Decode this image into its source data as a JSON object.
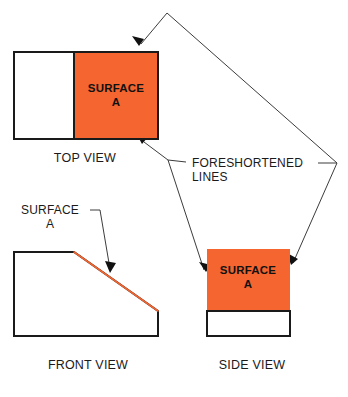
{
  "figure": {
    "title_text_present": false,
    "background_color": "#ffffff",
    "surface_color": "#f4652f",
    "line_color": "#1a1a1a",
    "leader_color": "#3c3c3c"
  },
  "views": {
    "top": {
      "label": "TOP VIEW",
      "label_x": 85,
      "label_y": 162,
      "outline": {
        "x": 14,
        "y": 52,
        "width": 144,
        "height": 87
      },
      "plain_part": {
        "x": 14,
        "y": 52,
        "width": 60,
        "height": 87
      },
      "surface_part": {
        "x": 74,
        "y": 52,
        "width": 84,
        "height": 87
      },
      "surface_label_line1": "SURFACE",
      "surface_label_line2": "A",
      "surface_label_x": 116,
      "surface_label_y": 92
    },
    "front": {
      "label": "FRONT VIEW",
      "label_x": 88,
      "label_y": 369,
      "outline_points": "14,252 74,252 158,311 158,336 14,336",
      "incline_points": "74,252 158,311",
      "callout_line1": "SURFACE",
      "callout_line2": "A",
      "callout_x": 50,
      "callout_y": 214
    },
    "side": {
      "label": "SIDE VIEW",
      "label_x": 252,
      "label_y": 369,
      "surface_part": {
        "x": 207,
        "y": 249,
        "width": 83,
        "height": 62
      },
      "plain_part": {
        "x": 207,
        "y": 311,
        "width": 83,
        "height": 25
      },
      "surface_label_line1": "SURFACE",
      "surface_label_line2": "A",
      "surface_label_x": 248,
      "surface_label_y": 274
    }
  },
  "callouts": {
    "foreshortened": {
      "line1": "FORESHORTENED",
      "line2": "LINES",
      "x": 192,
      "y_line1": 167,
      "y_line2": 181
    }
  },
  "leaders": {
    "top_apex": {
      "x": 167,
      "y": 13
    },
    "left_vertex": {
      "x": 168,
      "y": 160
    },
    "right_vertex": {
      "x": 337,
      "y": 163
    },
    "arrow_top_view_upper": {
      "x": 139,
      "y": 46
    },
    "arrow_top_view_lower": {
      "x": 142,
      "y": 144
    },
    "arrow_side_view_left": {
      "x": 206,
      "y": 272
    },
    "arrow_side_view_right": {
      "x": 291,
      "y": 265
    },
    "arrow_front_view_incline": {
      "x": 110,
      "y": 273
    },
    "front_callout_stub_start": {
      "x": 90,
      "y": 210
    },
    "front_callout_stub_end": {
      "x": 100,
      "y": 210
    },
    "foreshortened_stub_left_start": {
      "x": 168,
      "y": 160
    },
    "foreshortened_stub_left_end": {
      "x": 186,
      "y": 162
    },
    "foreshortened_stub_right_start": {
      "x": 318,
      "y": 163
    },
    "foreshortened_stub_right_end": {
      "x": 337,
      "y": 163
    }
  }
}
